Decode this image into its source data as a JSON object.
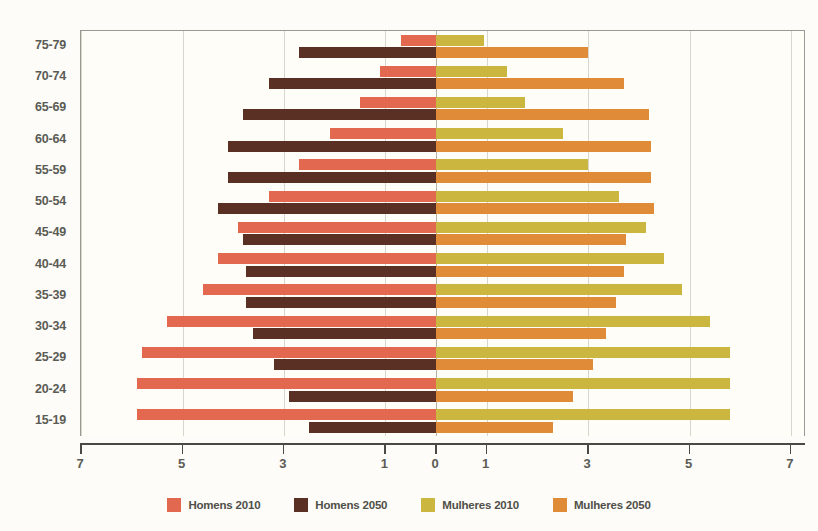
{
  "chart_data": {
    "type": "bar",
    "subtype": "population-pyramid",
    "title": "",
    "xlabel": "",
    "ylabel": "",
    "categories": [
      "75-79",
      "70-74",
      "65-69",
      "60-64",
      "55-59",
      "50-54",
      "45-49",
      "40-44",
      "35-39",
      "30-34",
      "25-29",
      "20-24",
      "15-19"
    ],
    "xlim": [
      -7,
      7
    ],
    "xticks": [
      7,
      5,
      3,
      1,
      0,
      1,
      3,
      5,
      7
    ],
    "xtick_labels": [
      "7",
      "5",
      "3",
      "1",
      "0",
      "1",
      "3",
      "5",
      "7"
    ],
    "grid": true,
    "legend_position": "bottom",
    "series": [
      {
        "name": "Homens 2010",
        "side": "left",
        "color": "#e2694f",
        "values": [
          0.7,
          1.1,
          1.5,
          2.1,
          2.7,
          3.3,
          3.9,
          4.3,
          4.6,
          5.3,
          5.8,
          5.9,
          5.9
        ]
      },
      {
        "name": "Homens 2050",
        "side": "left",
        "color": "#593023",
        "values": [
          2.7,
          3.3,
          3.8,
          4.1,
          4.1,
          4.3,
          3.8,
          3.75,
          3.75,
          3.6,
          3.2,
          2.9,
          2.5
        ]
      },
      {
        "name": "Mulheres 2010",
        "side": "right",
        "color": "#cbb73f",
        "values": [
          0.95,
          1.4,
          1.75,
          2.5,
          3.0,
          3.6,
          4.15,
          4.5,
          4.85,
          5.4,
          5.8,
          5.8,
          5.8
        ]
      },
      {
        "name": "Mulheres 2050",
        "side": "right",
        "color": "#e08b37",
        "values": [
          3.0,
          3.7,
          4.2,
          4.25,
          4.25,
          4.3,
          3.75,
          3.7,
          3.55,
          3.35,
          3.1,
          2.7,
          2.3
        ]
      }
    ]
  },
  "legend": {
    "items": [
      {
        "label": "Homens 2010",
        "color": "#e2694f"
      },
      {
        "label": "Homens 2050",
        "color": "#593023"
      },
      {
        "label": "Mulheres 2010",
        "color": "#cbb73f"
      },
      {
        "label": "Mulheres 2050",
        "color": "#e08b37"
      }
    ]
  }
}
